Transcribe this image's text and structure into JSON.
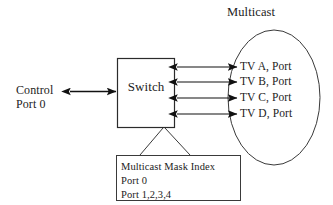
{
  "diagram": {
    "title_label": "Multicast",
    "control": {
      "line1": "Control",
      "line2": "Port 0"
    },
    "switch": {
      "label": "Switch"
    },
    "multicast_group": {
      "endpoints": [
        {
          "label": "TV A, Port"
        },
        {
          "label": "TV B, Port"
        },
        {
          "label": "TV C, Port"
        },
        {
          "label": "TV D, Port"
        }
      ]
    },
    "mask_callout": {
      "line1": "Multicast Mask Index",
      "line2": "Port 0",
      "line3": "Port 1,2,3,4"
    },
    "colors": {
      "stroke": "#2b2b2b",
      "arrow_fill": "#111111",
      "background": "#ffffff",
      "text": "#1c1c1c"
    },
    "icons": {
      "control_link": "double-arrow-icon",
      "endpoint_link": "double-arrow-icon"
    }
  }
}
